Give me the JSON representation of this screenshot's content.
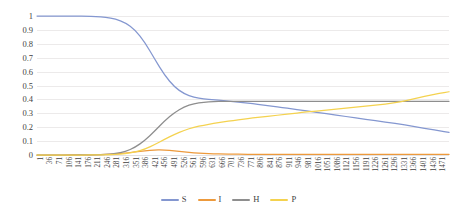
{
  "chart_data": {
    "type": "line",
    "title": "",
    "xlabel": "",
    "ylabel": "",
    "xlim": [
      1,
      1471
    ],
    "ylim": [
      0,
      1
    ],
    "grid": true,
    "legend_position": "bottom",
    "y_ticks": [
      "0",
      "0.1",
      "0.2",
      "0.3",
      "0.4",
      "0.5",
      "0.6",
      "0.7",
      "0.8",
      "0.9",
      "1"
    ],
    "x_ticks": [
      "1",
      "36",
      "71",
      "106",
      "141",
      "176",
      "211",
      "246",
      "281",
      "316",
      "351",
      "386",
      "421",
      "456",
      "491",
      "526",
      "561",
      "596",
      "631",
      "666",
      "701",
      "736",
      "771",
      "806",
      "841",
      "876",
      "911",
      "946",
      "981",
      "1016",
      "1051",
      "1086",
      "1121",
      "1156",
      "1191",
      "1226",
      "1261",
      "1296",
      "1331",
      "1366",
      "1401",
      "1436",
      "1471"
    ],
    "x": [
      1,
      36,
      71,
      106,
      141,
      176,
      211,
      246,
      281,
      316,
      351,
      386,
      421,
      456,
      491,
      526,
      561,
      596,
      631,
      666,
      701,
      736,
      771,
      806,
      841,
      876,
      911,
      946,
      981,
      1016,
      1051,
      1086,
      1121,
      1156,
      1191,
      1226,
      1261,
      1296,
      1331,
      1366,
      1401,
      1436,
      1471
    ],
    "series": [
      {
        "name": "S",
        "color": "#8497d0",
        "values": [
          1.0,
          1.0,
          1.0,
          1.0,
          0.999,
          0.998,
          0.996,
          0.99,
          0.978,
          0.952,
          0.9,
          0.81,
          0.69,
          0.575,
          0.49,
          0.44,
          0.415,
          0.403,
          0.397,
          0.391,
          0.385,
          0.377,
          0.369,
          0.36,
          0.351,
          0.342,
          0.332,
          0.322,
          0.312,
          0.302,
          0.292,
          0.282,
          0.272,
          0.262,
          0.252,
          0.242,
          0.232,
          0.222,
          0.21,
          0.198,
          0.186,
          0.174,
          0.162
        ]
      },
      {
        "name": "I",
        "color": "#ed9a3c",
        "values": [
          0.0,
          0.0,
          0.0,
          0.0,
          0.001,
          0.001,
          0.002,
          0.004,
          0.008,
          0.014,
          0.022,
          0.031,
          0.037,
          0.036,
          0.03,
          0.022,
          0.016,
          0.012,
          0.009,
          0.007,
          0.006,
          0.005,
          0.005,
          0.004,
          0.004,
          0.004,
          0.004,
          0.004,
          0.004,
          0.004,
          0.004,
          0.004,
          0.004,
          0.004,
          0.004,
          0.004,
          0.004,
          0.004,
          0.004,
          0.004,
          0.004,
          0.004,
          0.004
        ]
      },
      {
        "name": "H",
        "color": "#8e8e8e",
        "values": [
          0.0,
          0.0,
          0.0,
          0.0,
          0.0,
          0.001,
          0.002,
          0.004,
          0.01,
          0.024,
          0.055,
          0.105,
          0.172,
          0.245,
          0.305,
          0.347,
          0.37,
          0.381,
          0.385,
          0.386,
          0.386,
          0.386,
          0.386,
          0.386,
          0.386,
          0.386,
          0.386,
          0.386,
          0.386,
          0.386,
          0.386,
          0.386,
          0.386,
          0.386,
          0.386,
          0.386,
          0.386,
          0.386,
          0.386,
          0.386,
          0.386,
          0.386,
          0.386
        ]
      },
      {
        "name": "P",
        "color": "#f4d24f",
        "values": [
          0.0,
          0.0,
          0.0,
          0.0,
          0.0,
          0.0,
          0.001,
          0.002,
          0.004,
          0.01,
          0.021,
          0.042,
          0.075,
          0.112,
          0.148,
          0.178,
          0.2,
          0.215,
          0.227,
          0.238,
          0.248,
          0.257,
          0.266,
          0.274,
          0.282,
          0.29,
          0.298,
          0.306,
          0.313,
          0.32,
          0.327,
          0.334,
          0.341,
          0.348,
          0.355,
          0.362,
          0.37,
          0.382,
          0.398,
          0.414,
          0.43,
          0.443,
          0.455
        ]
      }
    ]
  }
}
